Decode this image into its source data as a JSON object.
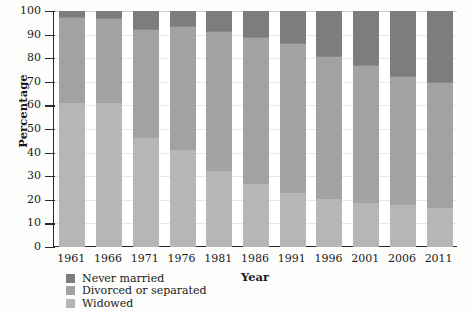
{
  "chart_data": {
    "type": "bar",
    "stacked": true,
    "title": "",
    "xlabel": "Year",
    "ylabel": "Percentage",
    "ylim": [
      0,
      100
    ],
    "ytick_step": 10,
    "grid": true,
    "legend_position": "bottom-left",
    "categories": [
      "1961",
      "1966",
      "1971",
      "1976",
      "1981",
      "1986",
      "1991",
      "1996",
      "2001",
      "2006",
      "2011"
    ],
    "yticks": [
      "0",
      "10",
      "20",
      "30",
      "40",
      "50",
      "60",
      "70",
      "80",
      "90",
      "100"
    ],
    "series": [
      {
        "name": "Widowed",
        "color": "#b6b6b4",
        "values": [
          61,
          61,
          46,
          41,
          32,
          26.5,
          23,
          20.5,
          18.5,
          18,
          16.5
        ]
      },
      {
        "name": "Divorced or separated",
        "color": "#a2a2a0",
        "values": [
          36.5,
          36,
          46.5,
          52.5,
          59.5,
          62.5,
          63.5,
          60.5,
          58.5,
          54.5,
          53.5
        ]
      },
      {
        "name": "Never married",
        "color": "#7d7d7b",
        "values": [
          2.5,
          3,
          7.5,
          6.5,
          8.5,
          11,
          13.5,
          19,
          23,
          27.5,
          30
        ]
      }
    ],
    "cumulative_tops": {
      "widowed": [
        61,
        61,
        46,
        41,
        32,
        26.5,
        23,
        20.5,
        18.5,
        18,
        16.5
      ],
      "divorced": [
        97.5,
        97,
        92.5,
        93.5,
        91.5,
        89,
        86.5,
        81,
        77,
        72.5,
        70
      ],
      "never": [
        100,
        100,
        100,
        100,
        100,
        100,
        100,
        100,
        100,
        100,
        100
      ]
    }
  },
  "legend": {
    "items": [
      {
        "label": "Never married",
        "color": "#7d7d7b"
      },
      {
        "label": "Divorced or separated",
        "color": "#a2a2a0"
      },
      {
        "label": "Widowed",
        "color": "#b6b6b4"
      }
    ]
  }
}
